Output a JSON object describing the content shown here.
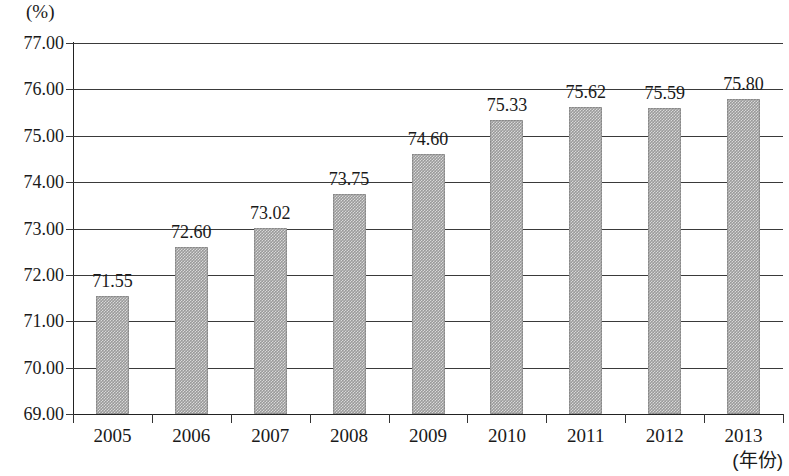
{
  "chart_data": {
    "type": "bar",
    "title": "",
    "subtitle": "",
    "xlabel": "(年份)",
    "ylabel": "(%)",
    "categories": [
      "2005",
      "2006",
      "2007",
      "2008",
      "2009",
      "2010",
      "2011",
      "2012",
      "2013"
    ],
    "values": [
      71.55,
      72.6,
      73.02,
      73.75,
      74.6,
      75.33,
      75.62,
      75.59,
      75.8
    ],
    "value_labels": [
      "71.55",
      "72.60",
      "73.02",
      "73.75",
      "74.60",
      "75.33",
      "75.62",
      "75.59",
      "75.80"
    ],
    "ylim": [
      69.0,
      77.0
    ],
    "ytick_step": 1.0,
    "ytick_labels": [
      "77.00",
      "76.00",
      "75.00",
      "74.00",
      "73.00",
      "72.00",
      "71.00",
      "70.00",
      "69.00"
    ],
    "ytick_values": [
      77.0,
      76.0,
      75.0,
      74.0,
      73.0,
      72.0,
      71.0,
      70.0,
      69.0
    ],
    "grid": true,
    "legend": false,
    "legend_position": "none",
    "series": [
      {
        "name": "",
        "color": "#9a9a9a",
        "values": [
          71.55,
          72.6,
          73.02,
          73.75,
          74.6,
          75.33,
          75.62,
          75.59,
          75.8
        ]
      }
    ],
    "bar_fill_color": "#9a9a9a",
    "axis_color": "#222222",
    "grid_color": "#3a3a3a",
    "background_color": "#ffffff"
  }
}
